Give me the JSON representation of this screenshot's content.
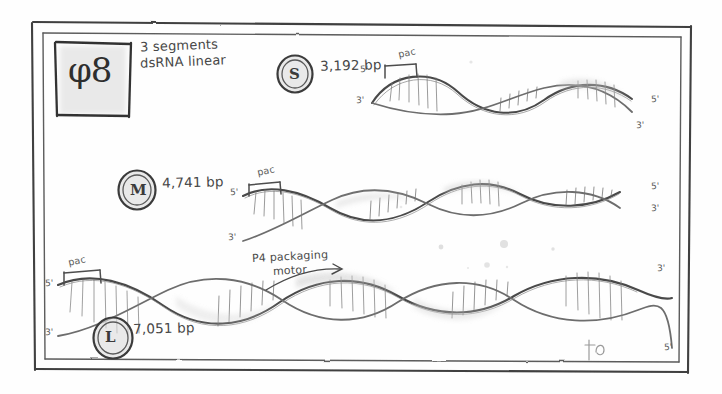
{
  "figure": {
    "kind": "hand-drawn-pencil-sketch",
    "ink_color": "#4a4a4a",
    "paper_color": "#fefefe"
  },
  "legend_box": {
    "virus_label": "φ8",
    "note_line_1": "3 segments",
    "note_line_2": "dsRNA linear"
  },
  "segments": [
    {
      "id": "s",
      "letter": "S",
      "length_label": "3,192 bp",
      "pac_label": "pac",
      "left_5_prime": "5'",
      "left_3_prime": "3'",
      "right_5_prime": "5'",
      "right_3_prime": "3'"
    },
    {
      "id": "m",
      "letter": "M",
      "length_label": "4,741 bp",
      "pac_label": "pac",
      "left_5_prime": "5'",
      "left_3_prime": "3'",
      "right_5_prime": "5'",
      "right_3_prime": "3'"
    },
    {
      "id": "l",
      "letter": "L",
      "length_label": "7,051 bp",
      "pac_label": "pac",
      "left_5_prime": "5'",
      "left_3_prime": "3'",
      "right_5_prime": "3'",
      "right_3_prime": "5'"
    }
  ],
  "annotations": {
    "motor_line_1": "P4 packaging",
    "motor_line_2": "motor",
    "signature": "jp"
  }
}
